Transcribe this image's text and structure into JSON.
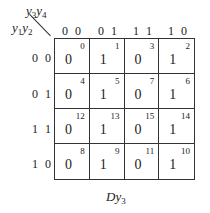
{
  "kmap": {
    "col_var": {
      "a": "y",
      "a_sub": "3",
      "b": "y",
      "b_sub": "4"
    },
    "row_var": {
      "a": "y",
      "a_sub": "1",
      "b": "y",
      "b_sub": "2"
    },
    "col_labels": [
      "0 0",
      "0 1",
      "1 1",
      "1 0"
    ],
    "row_labels": [
      "0 0",
      "0 1",
      "1 1",
      "1 0"
    ],
    "cells": [
      [
        {
          "value": "0",
          "index": "0"
        },
        {
          "value": "1",
          "index": "1"
        },
        {
          "value": "0",
          "index": "3"
        },
        {
          "value": "1",
          "index": "2"
        }
      ],
      [
        {
          "value": "0",
          "index": "4"
        },
        {
          "value": "1",
          "index": "5"
        },
        {
          "value": "0",
          "index": "7"
        },
        {
          "value": "1",
          "index": "6"
        }
      ],
      [
        {
          "value": "0",
          "index": "12"
        },
        {
          "value": "1",
          "index": "13"
        },
        {
          "value": "0",
          "index": "15"
        },
        {
          "value": "1",
          "index": "14"
        }
      ],
      [
        {
          "value": "0",
          "index": "8"
        },
        {
          "value": "1",
          "index": "9"
        },
        {
          "value": "0",
          "index": "11"
        },
        {
          "value": "1",
          "index": "10"
        }
      ]
    ],
    "caption": {
      "main": "Dy",
      "sub": "3"
    }
  }
}
